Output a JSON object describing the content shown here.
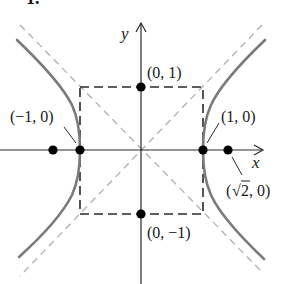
{
  "problem_number": "1.",
  "colors": {
    "axis": "#2a2a2a",
    "hyperbola": "#7a7a7a",
    "asymptote": "#b0b0b0",
    "box": "#2a2a2a",
    "point": "#000000",
    "text": "#1a1a1a"
  },
  "axes": {
    "x_label": "x",
    "y_label": "y"
  },
  "curve": {
    "equation": "x^2 - y^2 = 1",
    "type": "hyperbola"
  },
  "asymptotes": [
    "y = x",
    "y = -x"
  ],
  "box": {
    "corners": [
      [
        -1,
        1
      ],
      [
        1,
        1
      ],
      [
        1,
        -1
      ],
      [
        -1,
        -1
      ]
    ],
    "style": "dashed"
  },
  "points": [
    {
      "id": "vertex-left",
      "x": -1,
      "y": 0,
      "label": "(−1, 0)"
    },
    {
      "id": "vertex-right",
      "x": 1,
      "y": 0,
      "label": "(1, 0)"
    },
    {
      "id": "co-vertex-top",
      "x": 0,
      "y": 1,
      "label": "(0, 1)"
    },
    {
      "id": "co-vertex-bottom",
      "x": 0,
      "y": -1,
      "label": "(0, −1)"
    },
    {
      "id": "focus-right",
      "x": 1.414,
      "y": 0,
      "label": "(√2, 0)"
    },
    {
      "id": "focus-left",
      "x": -1.414,
      "y": 0,
      "label": ""
    }
  ],
  "labels": {
    "vertex_left": "(−1, 0)",
    "vertex_right": "(1, 0)",
    "co_vertex_top": "(0, 1)",
    "co_vertex_bottom": "(0, −1)",
    "focus_right_open": "(",
    "focus_right_root": "√",
    "focus_right_rest": "2, 0)"
  }
}
